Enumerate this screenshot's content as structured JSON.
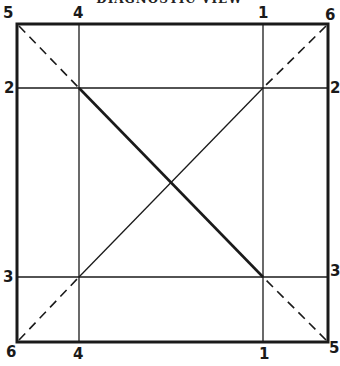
{
  "title": "DIAGNOSTIC VIEW",
  "colors": {
    "ink": "#1a1a1a",
    "background": "#ffffff"
  },
  "labels": {
    "top_left": "5",
    "top_4": "4",
    "top_1": "1",
    "top_right": "6",
    "left_2": "2",
    "right_2": "2",
    "left_3": "3",
    "right_3": "3",
    "bottom_left": "6",
    "bottom_4": "4",
    "bottom_1": "1",
    "bottom_right": "5"
  }
}
